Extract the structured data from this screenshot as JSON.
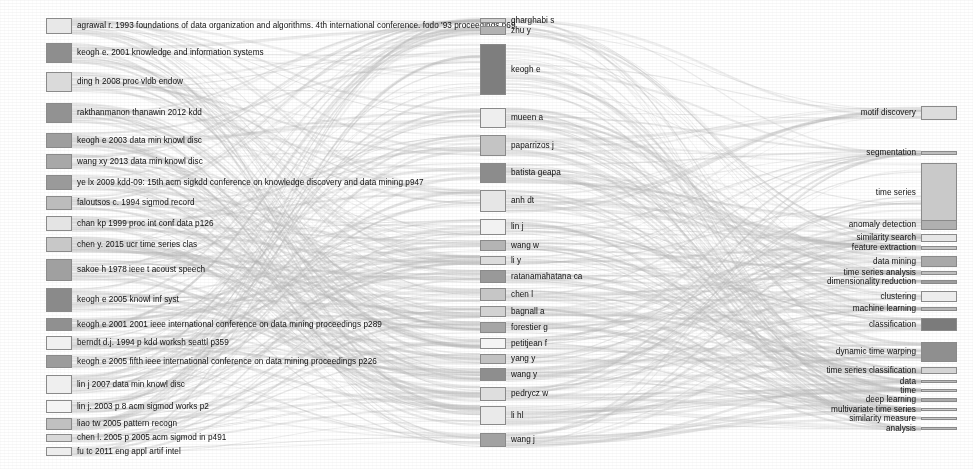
{
  "figure": {
    "type": "sankey",
    "title": "",
    "background": "#ffffff",
    "width": 973,
    "height": 469,
    "columns": [
      {
        "name": "cited-references",
        "label_side": "right",
        "x": 46,
        "node_width": 26
      },
      {
        "name": "cited-authors",
        "label_side": "right",
        "x": 480,
        "node_width": 26
      },
      {
        "name": "keywords",
        "label_side": "left",
        "x": 921,
        "node_width": 36
      }
    ],
    "node_border": "#8a8a8a",
    "ribbon_color": "#b9b9b9"
  },
  "chart_data": {
    "type": "sankey",
    "title": "",
    "xlabel": "",
    "ylabel": "",
    "legend": "none",
    "grid": false,
    "columns": [
      "cited references",
      "cited authors",
      "keywords"
    ],
    "nodes": {
      "cited_references": [
        {
          "label": "agrawal r. 1993 foundations of data organization and algorithms. 4th international conference. fodo '93 proceedings p69",
          "y": 18,
          "h": 16,
          "shade": "#e8e8e8"
        },
        {
          "label": "keogh e. 2001 knowledge and information systems",
          "y": 43,
          "h": 20,
          "shade": "#8e8e8e"
        },
        {
          "label": "ding h 2008 proc vldb endow",
          "y": 72,
          "h": 20,
          "shade": "#dadada"
        },
        {
          "label": "rakthanmanon thanawin 2012 kdd",
          "y": 103,
          "h": 20,
          "shade": "#929292"
        },
        {
          "label": "keogh e 2003 data min knowl disc",
          "y": 133,
          "h": 15,
          "shade": "#9e9e9e"
        },
        {
          "label": "wang xy 2013 data min knowl disc",
          "y": 154,
          "h": 15,
          "shade": "#a8a8a8"
        },
        {
          "label": "ye lx 2009 kdd-09: 15th acm sigkdd conference on knowledge discovery and data mining p947",
          "y": 175,
          "h": 15,
          "shade": "#9a9a9a"
        },
        {
          "label": "faloutsos c. 1994 sigmod record",
          "y": 196,
          "h": 14,
          "shade": "#bcbcbc"
        },
        {
          "label": "chan kp 1999 proc int conf data p126",
          "y": 216,
          "h": 15,
          "shade": "#e4e4e4"
        },
        {
          "label": "chen y. 2015 ucr time series clas",
          "y": 237,
          "h": 15,
          "shade": "#c8c8c8"
        },
        {
          "label": "sakoe h 1978 ieee t acoust speech",
          "y": 259,
          "h": 22,
          "shade": "#a0a0a0"
        },
        {
          "label": "keogh e 2005 knowl inf syst",
          "y": 288,
          "h": 24,
          "shade": "#8a8a8a"
        },
        {
          "label": "keogh e 2001 2001 ieee international conference on data mining proceedings p289",
          "y": 318,
          "h": 13,
          "shade": "#909090"
        },
        {
          "label": "berndt d.j. 1994 p kdd worksh seattl p359",
          "y": 336,
          "h": 14,
          "shade": "#f0f0f0"
        },
        {
          "label": "keogh e 2005 fifth ieee international conference on data mining proceedings p226",
          "y": 355,
          "h": 13,
          "shade": "#9c9c9c"
        },
        {
          "label": "lin j 2007 data min knowl disc",
          "y": 375,
          "h": 19,
          "shade": "#efefef"
        },
        {
          "label": "lin j. 2003 p 8 acm sigmod works p2",
          "y": 400,
          "h": 13,
          "shade": "#f4f4f4"
        },
        {
          "label": "liao tw 2005 pattern recogn",
          "y": 418,
          "h": 12,
          "shade": "#c0c0c0"
        },
        {
          "label": "chen l. 2005 p 2005 acm sigmod in p491",
          "y": 434,
          "h": 8,
          "shade": "#d8d8d8"
        },
        {
          "label": "fu tc 2011 eng appl artif intel",
          "y": 447,
          "h": 9,
          "shade": "#ededed"
        }
      ],
      "cited_authors": [
        {
          "label": "gharghabi s",
          "y": 18,
          "h": 5,
          "shade": "#cfcfcf"
        },
        {
          "label": "zhu y",
          "y": 26,
          "h": 9,
          "shade": "#b2b2b2"
        },
        {
          "label": "keogh e",
          "y": 44,
          "h": 51,
          "shade": "#7e7e7e"
        },
        {
          "label": "mueen a",
          "y": 108,
          "h": 20,
          "shade": "#eeeeee"
        },
        {
          "label": "paparrizos j",
          "y": 135,
          "h": 21,
          "shade": "#c4c4c4"
        },
        {
          "label": "batista geapa",
          "y": 163,
          "h": 20,
          "shade": "#8c8c8c"
        },
        {
          "label": "anh dt",
          "y": 190,
          "h": 22,
          "shade": "#e6e6e6"
        },
        {
          "label": "lin j",
          "y": 219,
          "h": 16,
          "shade": "#f2f2f2"
        },
        {
          "label": "wang w",
          "y": 240,
          "h": 11,
          "shade": "#b4b4b4"
        },
        {
          "label": "li y",
          "y": 256,
          "h": 9,
          "shade": "#dcdcdc"
        },
        {
          "label": "ratanamahatana ca",
          "y": 270,
          "h": 13,
          "shade": "#999999"
        },
        {
          "label": "chen l",
          "y": 288,
          "h": 13,
          "shade": "#c6c6c6"
        },
        {
          "label": "bagnall a",
          "y": 306,
          "h": 11,
          "shade": "#d2d2d2"
        },
        {
          "label": "forestier g",
          "y": 322,
          "h": 11,
          "shade": "#a6a6a6"
        },
        {
          "label": "petitjean f",
          "y": 338,
          "h": 11,
          "shade": "#f4f4f4"
        },
        {
          "label": "yang y",
          "y": 354,
          "h": 10,
          "shade": "#c2c2c2"
        },
        {
          "label": "wang y",
          "y": 368,
          "h": 13,
          "shade": "#8e8e8e"
        },
        {
          "label": "pedrycz w",
          "y": 387,
          "h": 14,
          "shade": "#dedede"
        },
        {
          "label": "li hl",
          "y": 406,
          "h": 19,
          "shade": "#eaeaea"
        },
        {
          "label": "wang j",
          "y": 433,
          "h": 14,
          "shade": "#a2a2a2"
        }
      ],
      "keywords": [
        {
          "label": "motif discovery",
          "y": 106,
          "h": 14,
          "shade": "#dcdcdc"
        },
        {
          "label": "segmentation",
          "y": 151,
          "h": 4,
          "shade": "#bdbdbd"
        },
        {
          "label": "time series",
          "y": 163,
          "h": 60,
          "shade": "#c9c9c9"
        },
        {
          "label": "anomaly detection",
          "y": 220,
          "h": 10,
          "shade": "#b0b0b0"
        },
        {
          "label": "similarity search",
          "y": 234,
          "h": 8,
          "shade": "#e6e6e6"
        },
        {
          "label": "feature extraction",
          "y": 246,
          "h": 4,
          "shade": "#c4c4c4"
        },
        {
          "label": "data mining",
          "y": 256,
          "h": 11,
          "shade": "#a9a9a9"
        },
        {
          "label": "time series analysis",
          "y": 271,
          "h": 4,
          "shade": "#bfbfbf"
        },
        {
          "label": "dimensionality reduction",
          "y": 280,
          "h": 4,
          "shade": "#9d9d9d"
        },
        {
          "label": "clustering",
          "y": 291,
          "h": 11,
          "shade": "#ededed"
        },
        {
          "label": "machine learning",
          "y": 307,
          "h": 4,
          "shade": "#b6b6b6"
        },
        {
          "label": "classification",
          "y": 318,
          "h": 13,
          "shade": "#7b7b7b"
        },
        {
          "label": "dynamic time warping",
          "y": 342,
          "h": 20,
          "shade": "#8f8f8f"
        },
        {
          "label": "time series classification",
          "y": 367,
          "h": 7,
          "shade": "#d4d4d4"
        },
        {
          "label": "data",
          "y": 380,
          "h": 3,
          "shade": "#b8b8b8"
        },
        {
          "label": "time",
          "y": 389,
          "h": 3,
          "shade": "#c0c0c0"
        },
        {
          "label": "deep learning",
          "y": 398,
          "h": 4,
          "shade": "#aaaaaa"
        },
        {
          "label": "multivariate time series",
          "y": 408,
          "h": 3,
          "shade": "#d0d0d0"
        },
        {
          "label": "similarity measure",
          "y": 417,
          "h": 3,
          "shade": "#c8c8c8"
        },
        {
          "label": "analysis",
          "y": 427,
          "h": 3,
          "shade": "#bbbbbb"
        }
      ]
    }
  }
}
